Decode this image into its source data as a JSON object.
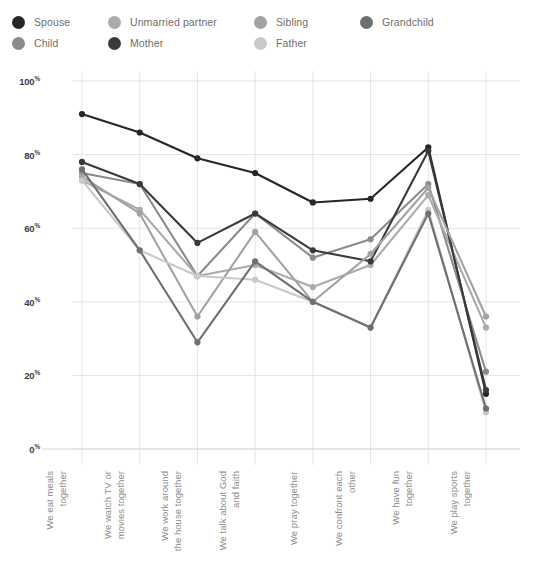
{
  "legend": {
    "items": [
      {
        "label": "Spouse",
        "color": "#262626",
        "col": 0,
        "row": 0
      },
      {
        "label": "Child",
        "color": "#8b8b8b",
        "col": 0,
        "row": 1
      },
      {
        "label": "Unmarried partner",
        "color": "#ababab",
        "col": 1,
        "row": 0
      },
      {
        "label": "Mother",
        "color": "#3a3a3a",
        "col": 1,
        "row": 1
      },
      {
        "label": "Sibling",
        "color": "#a2a2a2",
        "col": 2,
        "row": 0
      },
      {
        "label": "Father",
        "color": "#c9c9c9",
        "col": 2,
        "row": 1
      },
      {
        "label": "Grandchild",
        "color": "#6f6f6f",
        "col": 3,
        "row": 0
      }
    ]
  },
  "chart_data": {
    "type": "line",
    "title": "",
    "xlabel": "",
    "ylabel": "",
    "ylim": [
      0,
      100
    ],
    "ytick_values": [
      0,
      20,
      40,
      60,
      80,
      100
    ],
    "ytick_labels": [
      "0%",
      "20%",
      "40%",
      "60%",
      "80%",
      "100%"
    ],
    "grid": true,
    "legend_position": "top",
    "categories": [
      "We eat meals together",
      "We watch TV or movies together",
      "We work around the house together",
      "We talk about God and faith",
      "We pray together",
      "We confront each other",
      "We have fun together",
      "We play sports together"
    ],
    "category_lines": [
      [
        "We eat meals",
        "together"
      ],
      [
        "We watch TV or",
        "movies together"
      ],
      [
        "We work around",
        "the house together"
      ],
      [
        "We talk about God",
        "and faith"
      ],
      [
        "We pray together"
      ],
      [
        "We confront each",
        "other"
      ],
      [
        "We have fun",
        "together"
      ],
      [
        "We play sports",
        "together"
      ]
    ],
    "series": [
      {
        "name": "Spouse",
        "color": "#262626",
        "values": [
          91,
          86,
          79,
          75,
          67,
          68,
          82,
          15
        ]
      },
      {
        "name": "Child",
        "color": "#8b8b8b",
        "values": [
          75,
          72,
          47,
          64,
          52,
          57,
          72,
          21
        ]
      },
      {
        "name": "Unmarried partner",
        "color": "#ababab",
        "values": [
          73,
          65,
          47,
          50,
          44,
          50,
          69,
          33
        ]
      },
      {
        "name": "Mother",
        "color": "#3a3a3a",
        "values": [
          78,
          72,
          56,
          64,
          54,
          51,
          81,
          16
        ]
      },
      {
        "name": "Sibling",
        "color": "#a2a2a2",
        "values": [
          74,
          64,
          36,
          59,
          40,
          53,
          71,
          36
        ]
      },
      {
        "name": "Father",
        "color": "#c9c9c9",
        "values": [
          73,
          54,
          47,
          46,
          40,
          33,
          65,
          10
        ]
      },
      {
        "name": "Grandchild",
        "color": "#6f6f6f",
        "values": [
          76,
          54,
          29,
          51,
          40,
          33,
          64,
          11
        ]
      }
    ]
  },
  "axes": {
    "plot_left": 82,
    "plot_right": 520,
    "plot_top": 21,
    "plot_bottom": 389
  }
}
